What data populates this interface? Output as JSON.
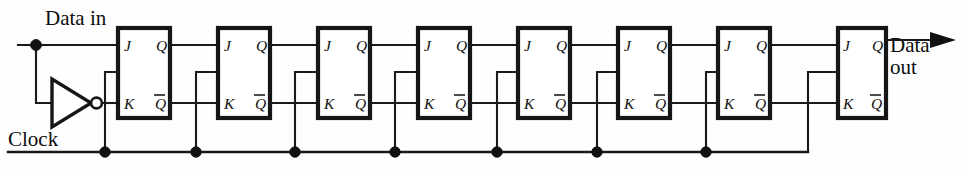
{
  "diagram": {
    "type": "digital-logic-schematic",
    "labels": {
      "data_in": "Data in",
      "data_out_line1": "Data",
      "data_out_line2": "out",
      "clock": "Clock"
    },
    "pins": {
      "j": "J",
      "k": "K",
      "q": "Q",
      "qbar": "Q"
    },
    "colors": {
      "wire": "#1a1a1a",
      "box_stroke": "#161616",
      "box_fill": "#ffffff",
      "junction": "#111111",
      "background": "#fefefe",
      "text": "#0d0d0d"
    },
    "stage_count": 8,
    "junction_dot_count": 8,
    "stages": [
      {
        "index": 1,
        "x": 118
      },
      {
        "index": 2,
        "x": 218
      },
      {
        "index": 3,
        "x": 318
      },
      {
        "index": 4,
        "x": 418
      },
      {
        "index": 5,
        "x": 518
      },
      {
        "index": 6,
        "x": 618
      },
      {
        "index": 7,
        "x": 718
      },
      {
        "index": 8,
        "x": 838
      }
    ],
    "inverter": {
      "name": "clock-inverter",
      "input_from": "Data in",
      "output_to": "K of stage 1"
    },
    "nets": [
      "Data in -> J1",
      "Data in -> inverter -> K1",
      "Q(n) -> J(n+1)",
      "Qbar(n) -> K(n+1)",
      "Clock bus -> all flip-flop clock inputs",
      "Q8 -> Data out"
    ]
  }
}
